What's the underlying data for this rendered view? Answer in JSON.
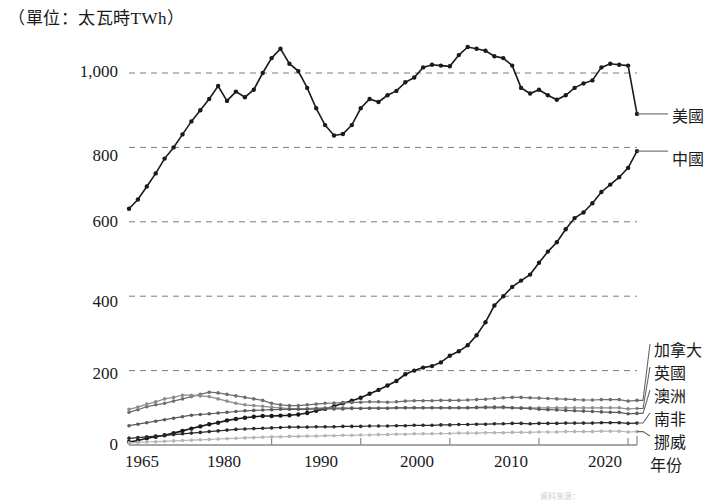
{
  "figure": {
    "unit_title": "（單位：太瓦時TWh）",
    "x_axis_name": "年份",
    "source_note": "資料來源："
  },
  "chart_data": {
    "type": "line",
    "title": "（單位：太瓦時TWh）",
    "xlabel": "年份",
    "ylabel": "太瓦時TWh",
    "xlim": [
      1964,
      2021
    ],
    "ylim": [
      0,
      1100
    ],
    "grid": true,
    "grid_axis": "y",
    "legend_position": "right",
    "y_ticks": [
      0,
      200,
      400,
      600,
      800,
      1000
    ],
    "y_tick_labels": [
      "0",
      "200",
      "400",
      "600",
      "800",
      "1,000"
    ],
    "x_ticks": [
      1965,
      1980,
      1990,
      2000,
      2010,
      2020
    ],
    "x_tick_labels": [
      "1965",
      "1980",
      "1990",
      "2000",
      "2010",
      "2020"
    ],
    "x": [
      1964,
      1965,
      1966,
      1967,
      1968,
      1969,
      1970,
      1971,
      1972,
      1973,
      1974,
      1975,
      1976,
      1977,
      1978,
      1979,
      1980,
      1981,
      1982,
      1983,
      1984,
      1985,
      1986,
      1987,
      1988,
      1989,
      1990,
      1991,
      1992,
      1993,
      1994,
      1995,
      1996,
      1997,
      1998,
      1999,
      2000,
      2001,
      2002,
      2003,
      2004,
      2005,
      2006,
      2007,
      2008,
      2009,
      2010,
      2011,
      2012,
      2013,
      2014,
      2015,
      2016,
      2017,
      2018,
      2019,
      2020,
      2021
    ],
    "series": [
      {
        "name": "美國",
        "color": "#1a1a1a",
        "values": [
          635,
          660,
          695,
          730,
          770,
          800,
          835,
          870,
          900,
          930,
          965,
          925,
          950,
          935,
          955,
          1000,
          1040,
          1065,
          1025,
          1005,
          960,
          905,
          860,
          832,
          836,
          860,
          905,
          930,
          922,
          940,
          952,
          975,
          988,
          1015,
          1022,
          1020,
          1018,
          1048,
          1070,
          1065,
          1060,
          1045,
          1040,
          1020,
          960,
          945,
          955,
          940,
          928,
          940,
          960,
          972,
          980,
          1015,
          1025,
          1022,
          1020,
          890
        ]
      },
      {
        "name": "中國",
        "color": "#1a1a1a",
        "values": [
          8,
          12,
          18,
          22,
          26,
          32,
          38,
          44,
          50,
          56,
          60,
          66,
          70,
          73,
          76,
          78,
          78,
          79,
          80,
          82,
          86,
          92,
          97,
          104,
          112,
          119,
          127,
          138,
          148,
          160,
          172,
          190,
          200,
          208,
          212,
          222,
          240,
          252,
          268,
          295,
          330,
          375,
          400,
          425,
          442,
          458,
          490,
          520,
          545,
          580,
          610,
          625,
          650,
          680,
          700,
          720,
          745,
          790
        ]
      },
      {
        "name": "加拿大",
        "color": "#6e6e6e",
        "values": [
          88,
          95,
          103,
          108,
          112,
          118,
          124,
          130,
          136,
          142,
          140,
          136,
          132,
          128,
          124,
          120,
          112,
          108,
          106,
          106,
          108,
          110,
          112,
          113,
          114,
          114,
          115,
          116,
          116,
          115,
          116,
          118,
          119,
          119,
          119,
          120,
          120,
          120,
          121,
          122,
          123,
          125,
          127,
          128,
          128,
          127,
          126,
          125,
          124,
          123,
          122,
          121,
          121,
          122,
          122,
          122,
          118,
          120
        ]
      },
      {
        "name": "英國",
        "color": "#8c8c8c",
        "values": [
          96,
          102,
          110,
          116,
          124,
          128,
          134,
          134,
          132,
          130,
          124,
          118,
          112,
          108,
          106,
          104,
          102,
          100,
          98,
          98,
          98,
          99,
          100,
          100,
          100,
          100,
          99,
          99,
          99,
          99,
          100,
          100,
          100,
          100,
          100,
          100,
          100,
          100,
          100,
          100,
          100,
          100,
          100,
          100,
          100,
          100,
          100,
          100,
          100,
          100,
          100,
          100,
          100,
          100,
          100,
          100,
          97,
          98
        ]
      },
      {
        "name": "澳洲",
        "color": "#5a5a5a",
        "values": [
          52,
          56,
          60,
          64,
          68,
          72,
          76,
          80,
          82,
          84,
          86,
          88,
          90,
          92,
          93,
          94,
          95,
          96,
          96,
          96,
          96,
          97,
          97,
          97,
          97,
          98,
          98,
          99,
          99,
          99,
          100,
          100,
          100,
          100,
          100,
          100,
          100,
          100,
          100,
          101,
          102,
          102,
          102,
          100,
          99,
          98,
          96,
          95,
          94,
          93,
          92,
          91,
          90,
          89,
          88,
          88,
          84,
          85
        ]
      },
      {
        "name": "南非",
        "color": "#2a2a2a",
        "values": [
          18,
          20,
          22,
          24,
          26,
          28,
          30,
          32,
          34,
          36,
          38,
          40,
          42,
          43,
          44,
          45,
          46,
          47,
          48,
          48,
          48,
          49,
          49,
          49,
          50,
          50,
          50,
          51,
          51,
          51,
          52,
          52,
          53,
          53,
          53,
          54,
          54,
          55,
          55,
          56,
          56,
          57,
          57,
          58,
          58,
          57,
          58,
          58,
          58,
          59,
          59,
          59,
          59,
          60,
          60,
          60,
          58,
          59
        ]
      },
      {
        "name": "挪威",
        "color": "#b5b5b5",
        "values": [
          6,
          7,
          8,
          9,
          10,
          11,
          12,
          13,
          14,
          15,
          16,
          17,
          18,
          19,
          20,
          21,
          22,
          22,
          23,
          23,
          24,
          24,
          25,
          25,
          26,
          26,
          27,
          27,
          28,
          28,
          29,
          29,
          30,
          30,
          30,
          31,
          31,
          32,
          32,
          32,
          33,
          33,
          33,
          34,
          34,
          34,
          35,
          35,
          35,
          36,
          36,
          36,
          36,
          37,
          37,
          37,
          35,
          36
        ]
      }
    ]
  },
  "legend": {
    "items": [
      {
        "label": "美國",
        "color": "#1a1a1a"
      },
      {
        "label": "中國",
        "color": "#1a1a1a"
      },
      {
        "label": "加拿大",
        "color": "#6e6e6e"
      },
      {
        "label": "英國",
        "color": "#8c8c8c"
      },
      {
        "label": "澳洲",
        "color": "#5a5a5a"
      },
      {
        "label": "南非",
        "color": "#2a2a2a"
      },
      {
        "label": "挪威",
        "color": "#b5b5b5"
      }
    ]
  },
  "y_axis": {
    "labels": [
      "1,000",
      "800",
      "600",
      "400",
      "200",
      "0"
    ]
  },
  "x_axis": {
    "labels": [
      "1965",
      "1980",
      "1990",
      "2000",
      "2010",
      "2020"
    ],
    "name": "年份"
  }
}
